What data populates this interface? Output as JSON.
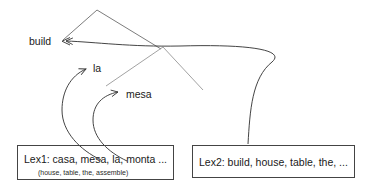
{
  "diagram": {
    "type": "lexical-transfer-tree",
    "background_color": "#ffffff",
    "line_color": "#3a3a3a",
    "text_color": "#1a1a1a",
    "nodes": [
      {
        "id": "build",
        "label": "build"
      },
      {
        "id": "la",
        "label": "la"
      },
      {
        "id": "mesa",
        "label": "mesa"
      }
    ],
    "boxes": [
      {
        "id": "lex1",
        "label": "Lex1: casa, mesa, la, monta ...",
        "sublabel": "(house, table, the, assemble)"
      },
      {
        "id": "lex2",
        "label": "Lex2: build, house, table, the, ...",
        "sublabel": ""
      }
    ],
    "arrows": [
      {
        "id": "lex2-to-build",
        "from": "lex2",
        "to": "build",
        "style": "curved",
        "arrowhead": "left"
      },
      {
        "id": "lex1-to-la",
        "from": "lex1",
        "to": "la",
        "style": "curved",
        "arrowhead": "up-right"
      },
      {
        "id": "lex1-to-mesa",
        "from": "lex1",
        "to": "mesa",
        "style": "curved",
        "arrowhead": "up-right"
      }
    ],
    "tree_edges": [
      {
        "id": "apex-left-branch"
      },
      {
        "id": "apex-right-branch"
      },
      {
        "id": "inner-left-branch"
      },
      {
        "id": "inner-right-branch"
      }
    ]
  }
}
